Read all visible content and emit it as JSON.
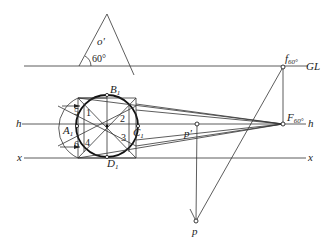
{
  "figure": {
    "type": "perspective-construction",
    "lines": {
      "ground_line": "GL",
      "horizon_line": "h",
      "x_axis": "x"
    },
    "angle": {
      "label": "60°",
      "vertex_label": "o'"
    },
    "points": {
      "f60": {
        "label": "f",
        "sub": "60°"
      },
      "F60": {
        "label": "F",
        "sub": "60°"
      },
      "p_prime": {
        "label": "p'"
      },
      "p": {
        "label": "p"
      },
      "A1": {
        "label": "A",
        "sub": "1"
      },
      "B1": {
        "label": "B",
        "sub": "1"
      },
      "C1": {
        "label": "C",
        "sub": "1"
      },
      "D1": {
        "label": "D",
        "sub": "1"
      }
    },
    "division_numbers": [
      "1",
      "2",
      "3",
      "4",
      "5",
      "6"
    ],
    "colors": {
      "stroke": "#222222",
      "background": "#ffffff"
    }
  }
}
